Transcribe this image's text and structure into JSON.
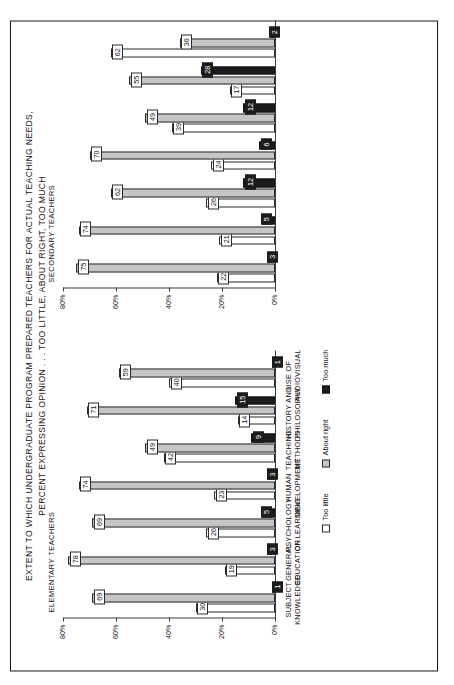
{
  "title": {
    "line1": "EXTENT TO WHICH UNDERGRADUATE PROGRAM PREPARED TEACHERS FOR ACTUAL TEACHING NEEDS,",
    "line2": "PERCENT EXPRESSING OPINION . . . TOO LITTLE, ABOUT RIGHT, TOO MUCH"
  },
  "panels": {
    "elementary_label": "ELEMENTARY TEACHERS",
    "secondary_label": "SECONDARY TEACHERS"
  },
  "legend": {
    "little": "Too little",
    "right": "About right",
    "much": "Too much"
  },
  "axis": {
    "ticks": [
      "0%",
      "20%",
      "40%",
      "60%",
      "80%"
    ],
    "tick_values": [
      0,
      20,
      40,
      60,
      80
    ],
    "max": 80
  },
  "categories": [
    {
      "l1": "SUBJECT",
      "l2": "KNOWLEDGE"
    },
    {
      "l1": "GENERAL",
      "l2": "EDUCATION"
    },
    {
      "l1": "PSYCHOLOGY",
      "l2": "OF LEARNING"
    },
    {
      "l1": "HUMAN",
      "l2": "DEVELOPMENT"
    },
    {
      "l1": "TEACHING",
      "l2": "METHODS"
    },
    {
      "l1": "HISTORY AND",
      "l2": "PHILOSOPHY"
    },
    {
      "l1": "USE OF",
      "l2": "AUDIOVISUAL"
    }
  ],
  "chart_data": {
    "type": "bar",
    "title": "EXTENT TO WHICH UNDERGRADUATE PROGRAM PREPARED TEACHERS FOR ACTUAL TEACHING NEEDS, PERCENT EXPRESSING OPINION . . . TOO LITTLE, ABOUT RIGHT, TOO MUCH",
    "xlabel": "",
    "ylabel": "Percent",
    "ylim": [
      0,
      80
    ],
    "grid": false,
    "orientation": "vertical",
    "legend_position": "bottom",
    "categories": [
      "SUBJECT KNOWLEDGE",
      "GENERAL EDUCATION",
      "PSYCHOLOGY OF LEARNING",
      "HUMAN DEVELOPMENT",
      "TEACHING METHODS",
      "HISTORY AND PHILOSOPHY",
      "USE OF AUDIOVISUAL"
    ],
    "panels": [
      {
        "name": "ELEMENTARY TEACHERS",
        "series": [
          {
            "name": "Too little",
            "values": [
              30,
              19,
              26,
              23,
              42,
              14,
              40
            ]
          },
          {
            "name": "About right",
            "values": [
              69,
              78,
              69,
              74,
              49,
              71,
              59
            ]
          },
          {
            "name": "Too much",
            "values": [
              1,
              3,
              5,
              3,
              9,
              15,
              1
            ]
          }
        ]
      },
      {
        "name": "SECONDARY TEACHERS",
        "series": [
          {
            "name": "Too little",
            "values": [
              22,
              21,
              26,
              24,
              39,
              17,
              62
            ]
          },
          {
            "name": "About right",
            "values": [
              75,
              74,
              62,
              70,
              49,
              55,
              36
            ]
          },
          {
            "name": "Too much",
            "values": [
              3,
              5,
              12,
              6,
              12,
              28,
              2
            ]
          }
        ]
      }
    ],
    "colors": {
      "little": "#ffffff",
      "right": "#c6c6c6",
      "much": "#1c1c1c",
      "axis": "#3a3a3a",
      "text": "#111111"
    }
  }
}
